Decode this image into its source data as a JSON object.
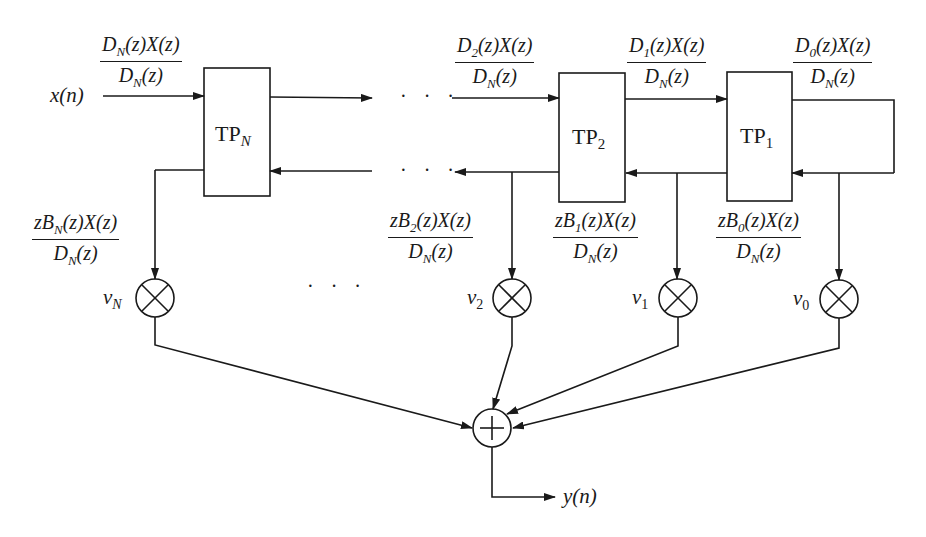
{
  "diagram": {
    "type": "lattice-ladder filter block diagram",
    "input_label": "x(n)",
    "output_label": "y(n)",
    "ellipsis": "· · ·",
    "blocks": [
      {
        "id": "TP_N",
        "label": "TP",
        "subscript": "N"
      },
      {
        "id": "TP_2",
        "label": "TP",
        "subscript": "2"
      },
      {
        "id": "TP_1",
        "label": "TP",
        "subscript": "1"
      }
    ],
    "forward_signals": [
      {
        "num": "D_N(z)X(z)",
        "den": "D_N(z)"
      },
      {
        "num": "D_2(z)X(z)",
        "den": "D_N(z)"
      },
      {
        "num": "D_1(z)X(z)",
        "den": "D_N(z)"
      },
      {
        "num": "D_0(z)X(z)",
        "den": "D_N(z)"
      }
    ],
    "backward_signals": [
      {
        "num": "zB_N(z)X(z)",
        "den": "D_N(z)"
      },
      {
        "num": "zB_2(z)X(z)",
        "den": "D_N(z)"
      },
      {
        "num": "zB_1(z)X(z)",
        "den": "D_N(z)"
      },
      {
        "num": "zB_0(z)X(z)",
        "den": "D_N(z)"
      }
    ],
    "multipliers": [
      {
        "label": "v",
        "subscript": "N"
      },
      {
        "label": "v",
        "subscript": "2"
      },
      {
        "label": "v",
        "subscript": "1"
      },
      {
        "label": "v",
        "subscript": "0"
      }
    ],
    "summer_symbol": "+",
    "multiplier_symbol": "×"
  }
}
